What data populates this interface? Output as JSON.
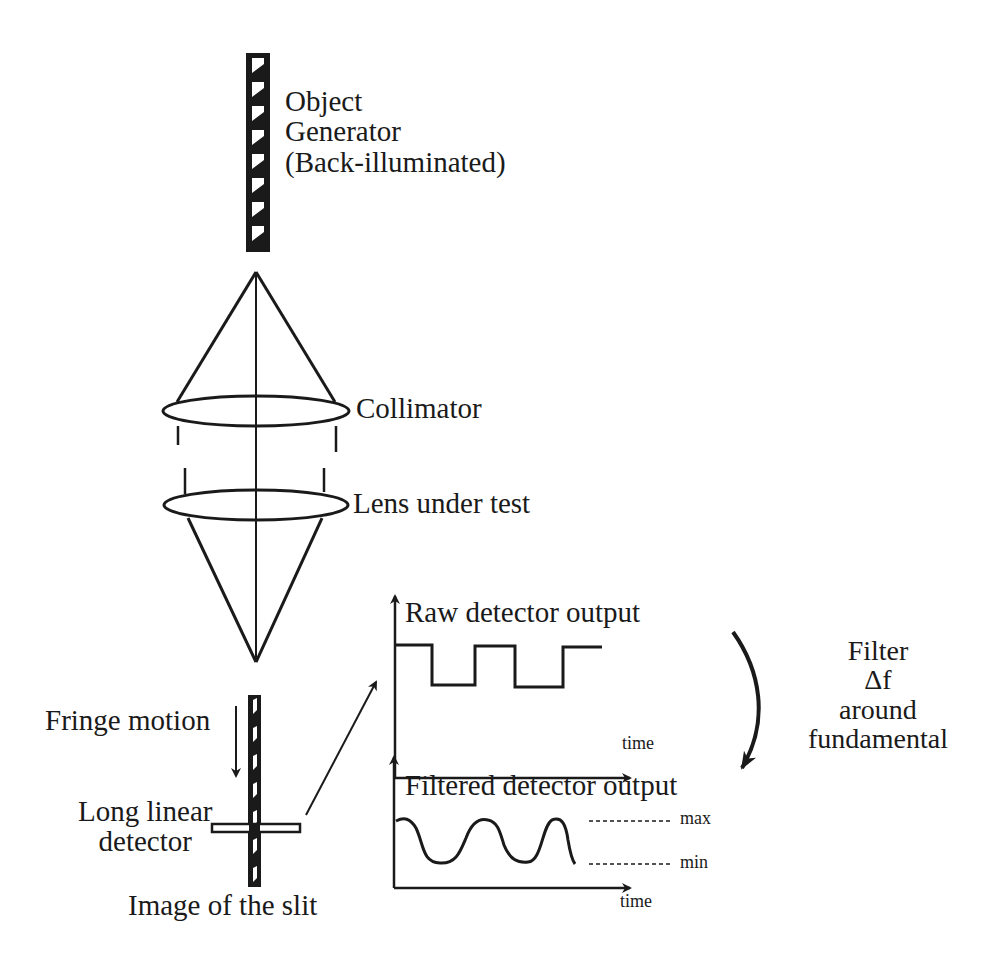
{
  "diagram": {
    "labels": {
      "object_generator": [
        "Object",
        "Generator",
        "(Back-illuminated)"
      ],
      "collimator": "Collimator",
      "lens_under_test": "Lens under test",
      "fringe_motion": "Fringe motion",
      "long_linear_detector": [
        "Long linear",
        "detector"
      ],
      "image_of_slit": "Image of the slit",
      "raw_output": "Raw detector output",
      "filtered_output": "Filtered detector output",
      "time_axis_raw": "time",
      "time_axis_filtered": "time",
      "max": "max",
      "min": "min",
      "filter": [
        "Filter",
        "Δf",
        "around",
        "fundamental"
      ]
    },
    "components": [
      {
        "id": "object-generator",
        "type": "striped-bar",
        "x": 248,
        "y": 55,
        "w": 20,
        "h": 195
      },
      {
        "id": "collimator",
        "type": "lens",
        "cx": 256,
        "cy": 411,
        "rx": 92,
        "ry": 16
      },
      {
        "id": "lens-under-test",
        "type": "lens",
        "cx": 256,
        "cy": 505,
        "rx": 90,
        "ry": 16
      },
      {
        "id": "slit-image",
        "type": "striped-bar",
        "x": 250,
        "y": 696,
        "w": 10,
        "h": 190
      },
      {
        "id": "linear-detector",
        "type": "rect",
        "x": 210,
        "y": 822,
        "w": 90,
        "h": 9
      }
    ],
    "plots": {
      "raw": {
        "origin": [
          395,
          778
        ],
        "top": 600,
        "end": 630,
        "signal": "square",
        "high": 645,
        "low": 686
      },
      "filtered": {
        "origin": [
          395,
          888
        ],
        "top": 760,
        "end": 630,
        "signal": "sine",
        "high": 818,
        "low": 862
      }
    },
    "colors": {
      "ink": "#1a1a1a",
      "background": "#ffffff"
    }
  }
}
